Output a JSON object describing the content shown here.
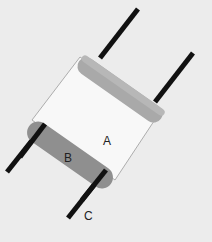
{
  "diagram": {
    "labels": {
      "a": "A",
      "b": "B",
      "c": "C"
    },
    "colors": {
      "background": "#ececec",
      "body_fill": "#f8f8f8",
      "body_stroke": "#9a9a9a",
      "top_cap": "#a9a9a9",
      "bottom_cap": "#8f8f8f",
      "leads": "#111111"
    }
  }
}
